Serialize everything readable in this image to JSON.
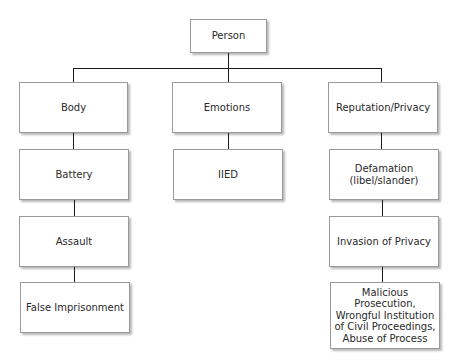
{
  "diagram": {
    "type": "tree",
    "root": {
      "label": "Person"
    },
    "branches": [
      {
        "label": "Body",
        "children": [
          "Battery",
          "Assault",
          "False Imprisonment"
        ]
      },
      {
        "label": "Emotions",
        "children": [
          "IIED"
        ]
      },
      {
        "label": "Reputation/Privacy",
        "children": [
          "Defamation\n(libel/slander)",
          "Invasion of Privacy",
          "Malicious Prosecution, Wrongful Institution of Civil Proceedings, Abuse of Process"
        ]
      }
    ]
  },
  "nodes": {
    "person": "Person",
    "body": "Body",
    "emotions": "Emotions",
    "reputation": "Reputation/Privacy",
    "battery": "Battery",
    "iied": "IIED",
    "defamation_1": "Defamation",
    "defamation_2": "(libel/slander)",
    "assault": "Assault",
    "invasion": "Invasion of Privacy",
    "false_imprisonment": "False Imprisonment",
    "malicious_1": "Malicious Prosecution,",
    "malicious_2": "Wrongful Institution",
    "malicious_3": "of Civil Proceedings,",
    "malicious_4": "Abuse of Process"
  }
}
